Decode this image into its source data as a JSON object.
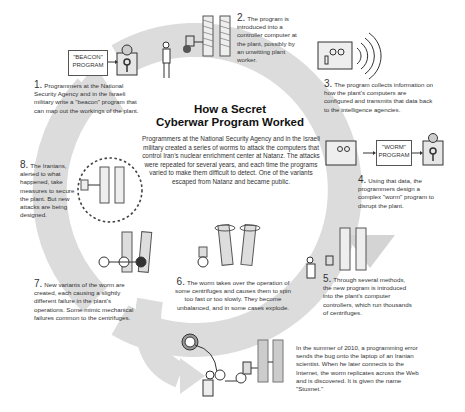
{
  "title": {
    "line1": "How a Secret",
    "line2": "Cyberwar Program Worked"
  },
  "intro": "Programmers at the National Security Agency and in the Israeli military created a series of worms to attack the computers that control Iran's nuclear enrichment center at Natanz. The attacks were repeated for several years, and each time the programs varied to make them difficult to detect. One of the variants escaped from Natanz and became public.",
  "boxes": {
    "beacon": "\"BEACON\" PROGRAM",
    "worm": "\"WORM\" PROGRAM"
  },
  "steps": [
    {
      "num": "1.",
      "text": "Programmers at the National Security Agency and in the Israeli military write a \"beacon\" program that can map out the workings of the plant."
    },
    {
      "num": "2.",
      "text": "The program is introduced into a controller computer at the plant, possibly by an unwitting plant worker."
    },
    {
      "num": "3.",
      "text": "The program collects information on how the plant's computers are configured and transmits that data back to the intelligence agencies."
    },
    {
      "num": "4.",
      "text": "Using that data, the programmers design a complex \"worm\" program to disrupt the plant."
    },
    {
      "num": "5.",
      "text": "Through several methods, the new program is introduced into the plant's computer controllers, which run thousands of centrifuges."
    },
    {
      "num": "6.",
      "text": "The worm takes over the operation of some centrifuges and causes them to spin too fast or too slowly. They become unbalanced, and in some cases explode."
    },
    {
      "num": "7.",
      "text": "New variants of the worm are created, each causing a slightly different failure in the plant's operations. Some mimic mechanical failures common to the centrifuges."
    },
    {
      "num": "8.",
      "text": "The Iranians, alerted to what happened, take measures to secure the plant. But new attacks are being designed."
    }
  ],
  "escape_note": "In the summer of 2010, a programming error sends the bug onto the laptop of an Iranian scientist. When he later connects to the Internet, the worm replicates across the Web and is discovered. It is given the name \"Stuxnet.\"",
  "colors": {
    "arc": "#d9d9d9",
    "arc_dark": "#c8c8c8",
    "ink": "#333333"
  }
}
